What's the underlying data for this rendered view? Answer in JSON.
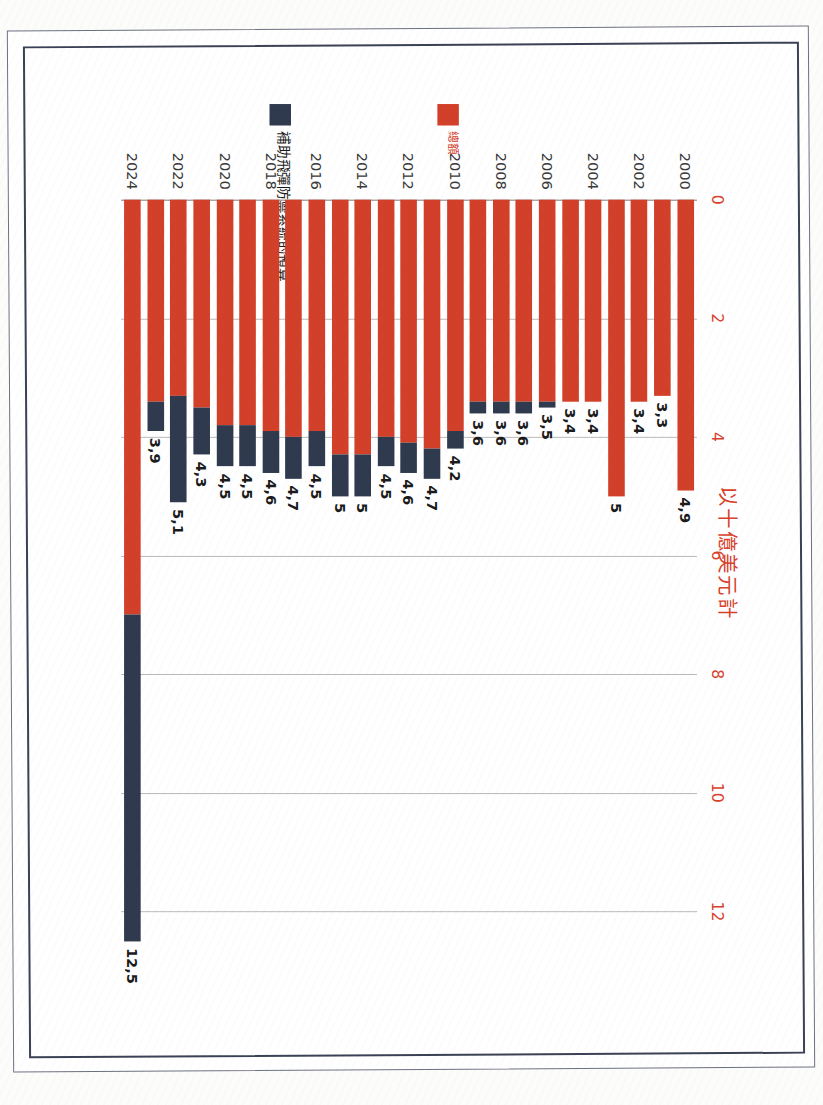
{
  "document": {
    "kind": "scanned-chart-page",
    "title": "以十億美元計"
  },
  "legend": {
    "position": "left",
    "items": [
      {
        "name": "total",
        "label": "總額",
        "color": "#d2402a"
      },
      {
        "name": "missile-defense",
        "label": "補助飛彈防禦系統的預算",
        "color": "#2f3a4e"
      }
    ]
  },
  "axis": {
    "tick_labels": [
      "0",
      "2",
      "4",
      "6",
      "8",
      "10",
      "12"
    ],
    "tick_values": [
      0,
      2,
      4,
      6,
      8,
      10,
      12
    ],
    "min": 0,
    "max": 13,
    "grid": true
  },
  "colors": {
    "total": "#d2402a",
    "missile": "#2f3a4e",
    "title": "#d8422b",
    "grid": "#b9b9b9",
    "frame_outer": "#6d7280",
    "frame_inner": "#3b4255"
  },
  "chart_data": {
    "type": "bar",
    "orientation": "horizontal-stacked",
    "title": "以十億美元計",
    "xlabel": "",
    "ylabel": "",
    "xlim": [
      0,
      13
    ],
    "grid": true,
    "legend_position": "left",
    "categories": [
      "2000",
      "2001",
      "2002",
      "2003",
      "2004",
      "2005",
      "2006",
      "2007",
      "2008",
      "2009",
      "2010",
      "2011",
      "2012",
      "2013",
      "2014",
      "2015",
      "2016",
      "2017",
      "2018",
      "2019",
      "2020",
      "2021",
      "2022",
      "2023",
      "2024"
    ],
    "tick_categories": [
      "2000",
      "2002",
      "2004",
      "2006",
      "2008",
      "2010",
      "2012",
      "2014",
      "2016",
      "2018",
      "2020",
      "2022",
      "2024"
    ],
    "series": [
      {
        "name": "總額",
        "color": "#d2402a",
        "values": [
          4.9,
          3.3,
          3.4,
          5.0,
          3.4,
          3.4,
          3.4,
          3.4,
          3.4,
          3.4,
          3.9,
          4.2,
          4.1,
          4.0,
          4.3,
          4.3,
          3.9,
          4.0,
          3.9,
          3.8,
          3.8,
          3.5,
          3.3,
          3.4,
          7.0
        ]
      },
      {
        "name": "補助飛彈防禦系統的預算",
        "color": "#2f3a4e",
        "values": [
          0.0,
          0.0,
          0.0,
          0.0,
          0.0,
          0.0,
          0.1,
          0.2,
          0.2,
          0.2,
          0.3,
          0.5,
          0.5,
          0.5,
          0.7,
          0.7,
          0.6,
          0.7,
          0.7,
          0.7,
          0.7,
          0.8,
          1.8,
          0.5,
          5.5
        ]
      }
    ],
    "data_labels": [
      "4,9",
      "3,3",
      "3,4",
      "5",
      "3,4",
      "3,4",
      "3,5",
      "3,6",
      "3,6",
      "3,6",
      "4,2",
      "4,7",
      "4,6",
      "4,5",
      "5",
      "5",
      "4,5",
      "4,7",
      "4,6",
      "4,5",
      "4,5",
      "4,3",
      "5,1",
      "3,9",
      "12,5"
    ],
    "totals": [
      4.9,
      3.3,
      3.4,
      5.0,
      3.4,
      3.4,
      3.5,
      3.6,
      3.6,
      3.6,
      4.2,
      4.7,
      4.6,
      4.5,
      5.0,
      5.0,
      4.5,
      4.7,
      4.6,
      4.5,
      4.5,
      4.3,
      5.1,
      3.9,
      12.5
    ]
  }
}
